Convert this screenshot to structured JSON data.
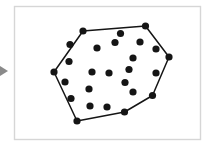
{
  "figure": {
    "canvas": {
      "width": 211,
      "height": 147,
      "background": "#ffffff"
    },
    "frame": {
      "name": "figure-border",
      "x": 14.5,
      "y": 6.5,
      "width": 186,
      "height": 133,
      "stroke": "#d6d6d6",
      "stroke_width": 1.4,
      "fill": "#ffffff"
    },
    "left_marker": {
      "name": "left-arrow-marker",
      "points": "0,66 8,71 0,76",
      "fill": "#8a8a8a"
    },
    "style": {
      "dot_color": "#151515",
      "dot_radius": 3.6,
      "hull_stroke": "#151515",
      "hull_stroke_width": 1.5,
      "hull_fill": "none"
    },
    "hull_vertices": [
      {
        "x": 83.0,
        "y": 31.0
      },
      {
        "x": 145.5,
        "y": 26.0
      },
      {
        "x": 169.0,
        "y": 57.0
      },
      {
        "x": 152.5,
        "y": 95.5
      },
      {
        "x": 124.5,
        "y": 112.0
      },
      {
        "x": 77.0,
        "y": 121.0
      },
      {
        "x": 54.0,
        "y": 72.0
      }
    ],
    "hull_path": "M 83.0 31.0 L 145.5 26.0 L 169.0 57.0 L 152.5 95.5 L 124.5 112.0 L 77.0 121.0 L 54.0 72.0 Z",
    "points": [
      {
        "x": 83.0,
        "y": 31.0,
        "on_hull": true
      },
      {
        "x": 145.5,
        "y": 26.0,
        "on_hull": true
      },
      {
        "x": 169.0,
        "y": 57.0,
        "on_hull": true
      },
      {
        "x": 152.5,
        "y": 95.5,
        "on_hull": true
      },
      {
        "x": 124.5,
        "y": 112.0,
        "on_hull": true
      },
      {
        "x": 77.0,
        "y": 121.0,
        "on_hull": true
      },
      {
        "x": 54.0,
        "y": 72.0,
        "on_hull": true
      },
      {
        "x": 69.0,
        "y": 61.5,
        "on_hull": false
      },
      {
        "x": 65.0,
        "y": 82.0,
        "on_hull": false
      },
      {
        "x": 71.0,
        "y": 98.5,
        "on_hull": false
      },
      {
        "x": 120.5,
        "y": 33.5,
        "on_hull": false
      },
      {
        "x": 115.0,
        "y": 42.5,
        "on_hull": false
      },
      {
        "x": 140.0,
        "y": 42.0,
        "on_hull": false
      },
      {
        "x": 156.0,
        "y": 49.0,
        "on_hull": false
      },
      {
        "x": 97.0,
        "y": 48.0,
        "on_hull": false
      },
      {
        "x": 133.0,
        "y": 58.0,
        "on_hull": false
      },
      {
        "x": 92.0,
        "y": 72.0,
        "on_hull": false
      },
      {
        "x": 109.0,
        "y": 73.0,
        "on_hull": false
      },
      {
        "x": 129.0,
        "y": 69.5,
        "on_hull": false
      },
      {
        "x": 156.0,
        "y": 73.0,
        "on_hull": false
      },
      {
        "x": 89.0,
        "y": 89.0,
        "on_hull": false
      },
      {
        "x": 125.0,
        "y": 82.5,
        "on_hull": false
      },
      {
        "x": 133.0,
        "y": 92.0,
        "on_hull": false
      },
      {
        "x": 90.0,
        "y": 106.0,
        "on_hull": false
      },
      {
        "x": 107.0,
        "y": 107.0,
        "on_hull": false
      },
      {
        "x": 70.0,
        "y": 44.5,
        "on_hull": false
      }
    ]
  }
}
